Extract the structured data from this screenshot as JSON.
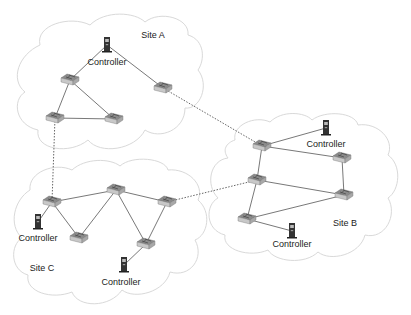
{
  "diagram": {
    "type": "network-topology",
    "colors": {
      "cloud_stroke": "#d9d9d9",
      "link": "#555555",
      "inter_site_link": "#666666",
      "switch_top": "#8a8a8a",
      "switch_side": "#c8c8c8",
      "server": "#333333"
    },
    "sites": [
      {
        "id": "A",
        "label": "Site A",
        "label_pos": [
          153,
          35
        ]
      },
      {
        "id": "B",
        "label": "Site B",
        "label_pos": [
          345,
          223
        ]
      },
      {
        "id": "C",
        "label": "Site C",
        "label_pos": [
          42,
          268
        ]
      }
    ],
    "controllers": [
      {
        "id": "ctrlA",
        "site": "A",
        "label": "Controller",
        "pos": [
          107,
          45
        ],
        "label_pos": [
          107,
          62
        ]
      },
      {
        "id": "ctrlB1",
        "site": "B",
        "label": "Controller",
        "pos": [
          326,
          128
        ],
        "label_pos": [
          326,
          144
        ]
      },
      {
        "id": "ctrlB2",
        "site": "B",
        "label": "Controller",
        "pos": [
          292,
          231
        ],
        "label_pos": [
          292,
          244
        ]
      },
      {
        "id": "ctrlC1",
        "site": "C",
        "label": "Controller",
        "pos": [
          38,
          222
        ],
        "label_pos": [
          38,
          238
        ]
      },
      {
        "id": "ctrlC2",
        "site": "C",
        "label": "Controller",
        "pos": [
          124,
          265
        ],
        "label_pos": [
          121,
          282
        ]
      }
    ],
    "switches": [
      {
        "id": "SA1",
        "site": "A",
        "pos": [
          70,
          80
        ]
      },
      {
        "id": "SA2",
        "site": "A",
        "pos": [
          55,
          118
        ]
      },
      {
        "id": "SA3",
        "site": "A",
        "pos": [
          114,
          119
        ]
      },
      {
        "id": "SA4",
        "site": "A",
        "pos": [
          163,
          88
        ]
      },
      {
        "id": "SB1",
        "site": "B",
        "pos": [
          262,
          146
        ]
      },
      {
        "id": "SB2",
        "site": "B",
        "pos": [
          342,
          158
        ]
      },
      {
        "id": "SB3",
        "site": "B",
        "pos": [
          257,
          180
        ]
      },
      {
        "id": "SB4",
        "site": "B",
        "pos": [
          344,
          195
        ]
      },
      {
        "id": "SB5",
        "site": "B",
        "pos": [
          247,
          219
        ]
      },
      {
        "id": "SC1",
        "site": "C",
        "pos": [
          52,
          202
        ]
      },
      {
        "id": "SC2",
        "site": "C",
        "pos": [
          116,
          190
        ]
      },
      {
        "id": "SC3",
        "site": "C",
        "pos": [
          167,
          202
        ]
      },
      {
        "id": "SC4",
        "site": "C",
        "pos": [
          79,
          238
        ]
      },
      {
        "id": "SC5",
        "site": "C",
        "pos": [
          146,
          244
        ]
      }
    ],
    "links": [
      {
        "from": "ctrlA",
        "to": "SA1",
        "style": "solid"
      },
      {
        "from": "ctrlA",
        "to": "SA4",
        "style": "solid"
      },
      {
        "from": "SA1",
        "to": "SA2",
        "style": "solid"
      },
      {
        "from": "SA1",
        "to": "SA3",
        "style": "solid"
      },
      {
        "from": "SA2",
        "to": "SA3",
        "style": "solid"
      },
      {
        "from": "SB1",
        "to": "ctrlB1",
        "style": "solid"
      },
      {
        "from": "SB1",
        "to": "SB2",
        "style": "solid"
      },
      {
        "from": "SB1",
        "to": "SB3",
        "style": "solid"
      },
      {
        "from": "SB2",
        "to": "SB4",
        "style": "solid"
      },
      {
        "from": "SB3",
        "to": "SB4",
        "style": "solid"
      },
      {
        "from": "SB3",
        "to": "SB5",
        "style": "solid"
      },
      {
        "from": "SB5",
        "to": "SB4",
        "style": "solid"
      },
      {
        "from": "SB5",
        "to": "ctrlB2",
        "style": "solid"
      },
      {
        "from": "SC1",
        "to": "SC2",
        "style": "solid"
      },
      {
        "from": "SC2",
        "to": "SC3",
        "style": "solid"
      },
      {
        "from": "SC1",
        "to": "ctrlC1",
        "style": "solid"
      },
      {
        "from": "SC1",
        "to": "SC4",
        "style": "solid"
      },
      {
        "from": "SC4",
        "to": "SC2",
        "style": "solid"
      },
      {
        "from": "SC2",
        "to": "SC5",
        "style": "solid"
      },
      {
        "from": "SC5",
        "to": "SC3",
        "style": "solid"
      },
      {
        "from": "SC5",
        "to": "ctrlC2",
        "style": "solid"
      },
      {
        "from": "SA4",
        "to": "SB1",
        "style": "dotted"
      },
      {
        "from": "SA2",
        "to": "SC1",
        "style": "dotted"
      },
      {
        "from": "SC3",
        "to": "SB3",
        "style": "dotted"
      }
    ]
  }
}
